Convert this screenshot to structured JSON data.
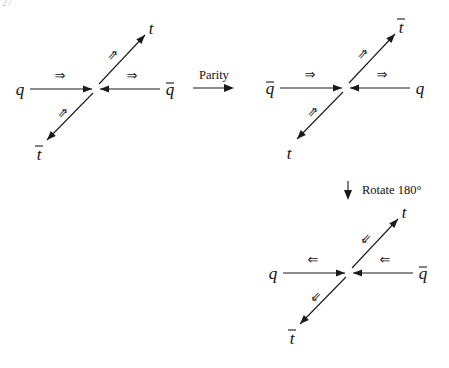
{
  "page_fragment": "27",
  "transforms": {
    "parity": {
      "label": "Parity",
      "x": 193,
      "y": 84
    },
    "rotate": {
      "label": "Rotate 180°",
      "x": 348,
      "y": 190
    }
  },
  "diagrams": [
    {
      "id": "original",
      "center": [
        96,
        89
      ],
      "incoming_left": {
        "particle": "q",
        "bar": false,
        "spin": "⇒"
      },
      "incoming_right": {
        "particle": "q",
        "bar": true,
        "spin": "⇒"
      },
      "outgoing_up": {
        "particle": "t",
        "bar": false,
        "spin": "⇒"
      },
      "outgoing_down": {
        "particle": "t",
        "bar": true,
        "spin": "⇒"
      }
    },
    {
      "id": "parity",
      "center": [
        346,
        88
      ],
      "incoming_left": {
        "particle": "q",
        "bar": true,
        "spin": "⇒"
      },
      "incoming_right": {
        "particle": "q",
        "bar": false,
        "spin": "⇒"
      },
      "outgoing_up": {
        "particle": "t",
        "bar": true,
        "spin": "⇒"
      },
      "outgoing_down": {
        "particle": "t",
        "bar": false,
        "spin": "⇒"
      }
    },
    {
      "id": "rotated",
      "center": [
        349,
        273
      ],
      "incoming_left": {
        "particle": "q",
        "bar": false,
        "spin": "⇐"
      },
      "incoming_right": {
        "particle": "q",
        "bar": true,
        "spin": "⇐"
      },
      "outgoing_up": {
        "particle": "t",
        "bar": false,
        "spin": "⇐"
      },
      "outgoing_down": {
        "particle": "t",
        "bar": true,
        "spin": "⇐"
      }
    }
  ]
}
